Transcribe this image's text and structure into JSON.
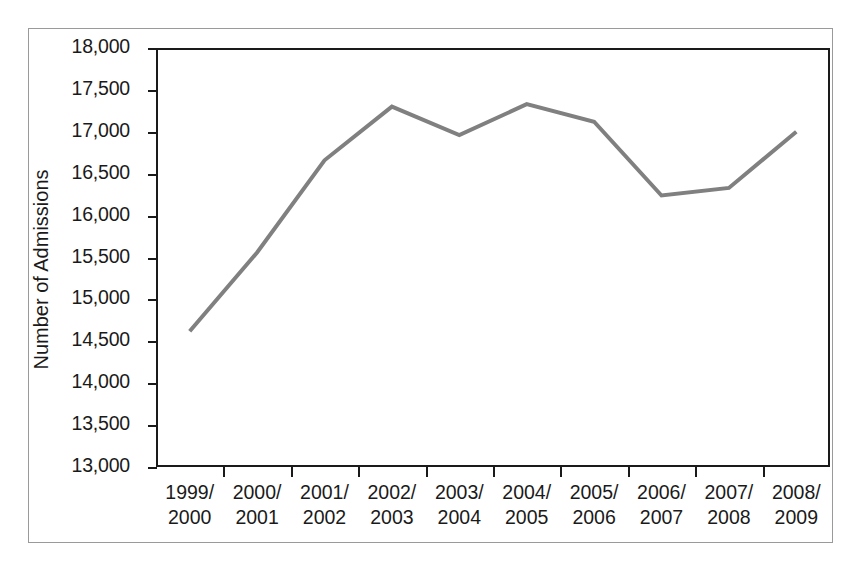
{
  "chart_data": {
    "type": "line",
    "title": "",
    "xlabel": "",
    "ylabel": "Number of Admissions",
    "categories": [
      "1999/\n2000",
      "2000/\n2001",
      "2001/\n2002",
      "2002/\n2003",
      "2003/\n2004",
      "2004/\n2005",
      "2005/\n2006",
      "2006/\n2007",
      "2007/\n2008",
      "2008/\n2009"
    ],
    "category_lines": [
      [
        "1999/",
        "2000"
      ],
      [
        "2000/",
        "2001"
      ],
      [
        "2001/",
        "2002"
      ],
      [
        "2002/",
        "2003"
      ],
      [
        "2003/",
        "2004"
      ],
      [
        "2004/",
        "2005"
      ],
      [
        "2005/",
        "2006"
      ],
      [
        "2006/",
        "2007"
      ],
      [
        "2007/",
        "2008"
      ],
      [
        "2008/",
        "2009"
      ]
    ],
    "values": [
      14620,
      15560,
      16660,
      17300,
      16960,
      17330,
      17120,
      16240,
      16330,
      17000
    ],
    "ylim": [
      13000,
      18000
    ],
    "ytick_values": [
      18000,
      17500,
      17000,
      16500,
      16000,
      15500,
      15000,
      14500,
      14000,
      13500,
      13000
    ],
    "ytick_labels": [
      "18,000",
      "17,500",
      "17,000",
      "16,500",
      "16,000",
      "15,500",
      "15,000",
      "14,500",
      "14,000",
      "13,500",
      "13,000"
    ],
    "grid": false,
    "legend": false,
    "series": [
      {
        "name": "Number of Admissions",
        "values": [
          14620,
          15560,
          16660,
          17300,
          16960,
          17330,
          17120,
          16240,
          16330,
          17000
        ],
        "color": "#808080",
        "line_width": 4
      }
    ],
    "colors": {
      "line": "#808080",
      "axis": "#1a1a1a",
      "text": "#1a1a1a",
      "frame": "#9a9a9a",
      "background": "#ffffff"
    }
  }
}
